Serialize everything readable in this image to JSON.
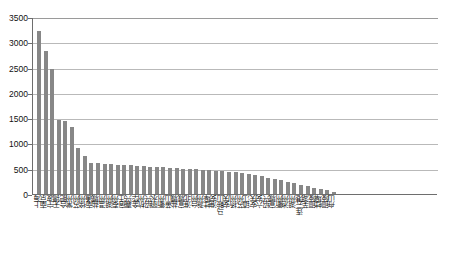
{
  "chart_data": {
    "type": "bar",
    "title": "",
    "xlabel": "",
    "ylabel": "",
    "ylim": [
      0,
      3500
    ],
    "yticks": [
      0,
      500,
      1000,
      1500,
      2000,
      2500,
      3000,
      3500
    ],
    "ytick_labels": [
      "0",
      "500",
      "1000",
      "1500",
      "2000",
      "2500",
      "3000",
      "3500"
    ],
    "grid": true,
    "legend": "none",
    "bar_color": "#878787",
    "categories": [
      "上海",
      "南京",
      "宁波",
      "无锡",
      "合肥",
      "常州",
      "苏州",
      "徐州",
      "南通",
      "盐城",
      "温州",
      "湖州",
      "泰州",
      "宿迁",
      "嘉兴",
      "金华",
      "杭州",
      "绍兴",
      "丽水",
      "衢州",
      "黄山",
      "盐城",
      "宣城",
      "淮北",
      "台州",
      "滁州",
      "蚌埠",
      "淮安",
      "马鞍山",
      "安庆",
      "扬州",
      "苏州",
      "镇江",
      "安庆",
      "六安",
      "绍兴",
      "宣城",
      "衢州",
      "池州",
      "湖州",
      "连云港",
      "芜湖",
      "铜陵",
      "蚌埠",
      "铜陵",
      "舟山"
    ],
    "values": [
      3250,
      2850,
      2490,
      1480,
      1450,
      1330,
      920,
      750,
      620,
      610,
      600,
      590,
      580,
      575,
      570,
      560,
      555,
      545,
      540,
      530,
      520,
      515,
      505,
      500,
      495,
      485,
      475,
      465,
      455,
      445,
      430,
      420,
      400,
      380,
      350,
      320,
      300,
      270,
      240,
      210,
      180,
      150,
      120,
      95,
      70,
      45
    ]
  }
}
